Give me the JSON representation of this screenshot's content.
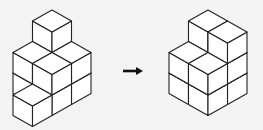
{
  "colors": {
    "background": "#f3f3f3",
    "cube_fill": "#ffffff",
    "stroke": "#222222",
    "arrow": "#111111"
  },
  "figures": [
    {
      "name": "before",
      "origin": [
        52,
        10
      ],
      "cubes": [
        [
          0,
          0,
          0
        ],
        [
          1,
          0,
          0
        ],
        [
          0,
          1,
          0
        ],
        [
          1,
          1,
          0
        ],
        [
          0,
          0,
          1
        ],
        [
          1,
          0,
          1
        ],
        [
          0,
          1,
          1
        ],
        [
          1,
          1,
          1
        ],
        [
          0,
          0,
          2
        ],
        [
          2,
          1,
          0
        ]
      ]
    },
    {
      "name": "after",
      "origin": [
        208,
        10
      ],
      "cubes": [
        [
          0,
          0,
          0
        ],
        [
          1,
          0,
          0
        ],
        [
          0,
          1,
          0
        ],
        [
          1,
          1,
          0
        ],
        [
          0,
          0,
          1
        ],
        [
          1,
          0,
          1
        ],
        [
          0,
          1,
          1
        ],
        [
          1,
          1,
          1
        ],
        [
          0,
          0,
          2
        ],
        [
          0,
          1,
          2
        ]
      ]
    }
  ],
  "arrow": {
    "direction": "right",
    "icon": "arrow-right-icon"
  },
  "iso": {
    "dx": 19.5,
    "dy": 11,
    "h": 20.5
  }
}
